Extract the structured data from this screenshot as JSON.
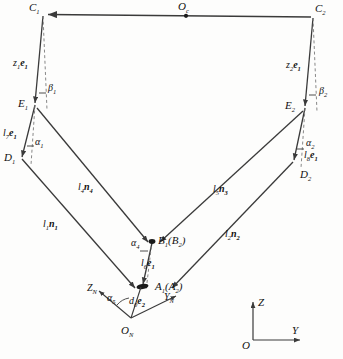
{
  "figure": {
    "type": "kinematic-mechanism-diagram",
    "ink_color": "#3a3a3a",
    "text_color": "#111111",
    "background": "#fdfdfc"
  },
  "nodes": {
    "c1": "C",
    "c1_sub": "1",
    "c2": "C",
    "c2_sub": "2",
    "oc": "O",
    "oc_sub": "c",
    "e1": "E",
    "e1_sub": "1",
    "e2": "E",
    "e2_sub": "2",
    "d1": "D",
    "d1_sub": "1",
    "d2": "D",
    "d2_sub": "2",
    "b": "B",
    "b_sub": "1",
    "b_paren_open": "(",
    "b2": "B",
    "b2_sub": "2",
    "b_paren_close": ")",
    "a": "A",
    "a_sub": "1",
    "a_paren_open": "(",
    "a2": "A",
    "a2_sub": "2",
    "a_paren_close": ")",
    "on": "O",
    "on_sub": "N"
  },
  "vectors": {
    "z1e1": {
      "len": "z",
      "len_sub": "1",
      "dir": "e",
      "dir_sub": "1"
    },
    "z2e1": {
      "len": "z",
      "len_sub": "2",
      "dir": "e",
      "dir_sub": "1"
    },
    "l7e1": {
      "len": "l",
      "len_sub": "7",
      "dir": "e",
      "dir_sub": "1"
    },
    "l8e1": {
      "len": "l",
      "len_sub": "8",
      "dir": "e",
      "dir_sub": "1"
    },
    "l6e1": {
      "len": "l",
      "len_sub": "6",
      "dir": "e",
      "dir_sub": "1"
    },
    "d0e2": {
      "len": "d",
      "len_sub": "0",
      "dir": "e",
      "dir_sub": "2"
    },
    "l4n4": {
      "len": "l",
      "len_sub": "4",
      "dir": "n",
      "dir_sub": "4"
    },
    "l1n1": {
      "len": "l",
      "len_sub": "1",
      "dir": "n",
      "dir_sub": "1"
    },
    "l5n3": {
      "len": "l",
      "len_sub": "5",
      "dir": "n",
      "dir_sub": "3"
    },
    "l2n2": {
      "len": "l",
      "len_sub": "2",
      "dir": "n",
      "dir_sub": "2"
    }
  },
  "angles": {
    "beta1": {
      "sym": "β",
      "sub": "1"
    },
    "beta2": {
      "sym": "β",
      "sub": "2"
    },
    "alpha1": {
      "sym": "α",
      "sub": "1"
    },
    "alpha2": {
      "sym": "α",
      "sub": "2"
    },
    "alpha4": {
      "sym": "α",
      "sub": "4"
    },
    "alpha5": {
      "sym": "α",
      "sub": "5"
    }
  },
  "frames": {
    "body": {
      "z_axis": "Z",
      "z_sub": "N",
      "y_axis": "Y",
      "y_sub": "N",
      "origin": "O",
      "origin_sub": "N"
    },
    "global": {
      "z_axis": "Z",
      "y_axis": "Y",
      "origin": "O"
    }
  }
}
